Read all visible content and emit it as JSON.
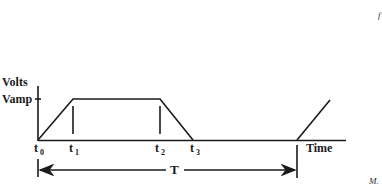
{
  "diagram": {
    "type": "trapezoidal-voltage-waveform",
    "y_axis_label": "Volts",
    "amplitude_label": "Vamp",
    "x_axis_label": "Time",
    "time_markers": [
      {
        "name": "t0",
        "base": "t",
        "sub": "0"
      },
      {
        "name": "t1",
        "base": "t",
        "sub": "1"
      },
      {
        "name": "t2",
        "base": "t",
        "sub": "2"
      },
      {
        "name": "t3",
        "base": "t",
        "sub": "3"
      }
    ],
    "period_label": "T",
    "corner_text_top": "f",
    "corner_text_bottom": "M."
  }
}
